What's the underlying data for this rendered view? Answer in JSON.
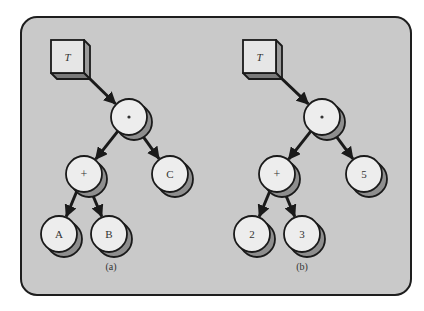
{
  "colors": {
    "panel_fill": "#c9c9c9",
    "panel_stroke": "#1e1e1e",
    "node_fill": "#ededed",
    "node_shadow": "#8e8e8e",
    "box_front": "#e6e6e6",
    "box_side": "#9a9a9a",
    "box_bottom": "#7a7a7a",
    "line": "#1a1a1a",
    "text": "#333333"
  },
  "panel": {
    "x": 21,
    "y": 17,
    "w": 390,
    "h": 278,
    "r": 16
  },
  "node_radius": 18,
  "shadow_offset": [
    5,
    5
  ],
  "box_size": 33,
  "box_depth": 6,
  "trees": [
    {
      "id": "a",
      "caption": "(a)",
      "caption_pos": [
        111,
        270
      ],
      "pointer": {
        "label": "T",
        "x": 51,
        "y": 40
      },
      "nodes": [
        {
          "id": "root",
          "label": "*",
          "x": 129,
          "y": 117
        },
        {
          "id": "plus",
          "label": "+",
          "x": 84,
          "y": 174
        },
        {
          "id": "c",
          "label": "C",
          "x": 170,
          "y": 174
        },
        {
          "id": "a",
          "label": "A",
          "x": 59,
          "y": 234
        },
        {
          "id": "b",
          "label": "B",
          "x": 109,
          "y": 234
        }
      ],
      "edges": [
        [
          "pointer",
          "root"
        ],
        [
          "root",
          "plus"
        ],
        [
          "root",
          "c"
        ],
        [
          "plus",
          "a"
        ],
        [
          "plus",
          "b"
        ]
      ]
    },
    {
      "id": "b",
      "caption": "(b)",
      "caption_pos": [
        302,
        270
      ],
      "pointer": {
        "label": "T",
        "x": 243,
        "y": 40
      },
      "nodes": [
        {
          "id": "root",
          "label": "*",
          "x": 322,
          "y": 117
        },
        {
          "id": "plus",
          "label": "+",
          "x": 277,
          "y": 174
        },
        {
          "id": "five",
          "label": "5",
          "x": 364,
          "y": 174
        },
        {
          "id": "two",
          "label": "2",
          "x": 252,
          "y": 234
        },
        {
          "id": "three",
          "label": "3",
          "x": 302,
          "y": 234
        }
      ],
      "edges": [
        [
          "pointer",
          "root"
        ],
        [
          "root",
          "plus"
        ],
        [
          "root",
          "five"
        ],
        [
          "plus",
          "two"
        ],
        [
          "plus",
          "three"
        ]
      ]
    }
  ]
}
